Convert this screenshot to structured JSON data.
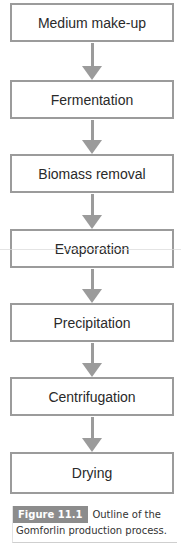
{
  "flowchart": {
    "steps": [
      {
        "label": "Medium make-up"
      },
      {
        "label": "Fermentation"
      },
      {
        "label": "Biomass removal"
      },
      {
        "label": "Evaporation"
      },
      {
        "label": "Precipitation"
      },
      {
        "label": "Centrifugation"
      },
      {
        "label": "Drying"
      }
    ],
    "colors": {
      "border": "#9b9b9b",
      "arrow": "#9b9b9b",
      "text": "#2a2a2a"
    }
  },
  "caption": {
    "figure_label": "Figure 11.1",
    "text_line1": "Outline of the",
    "text_line2": "Gomforlin production process.",
    "badge_color": "#8c8c8c"
  }
}
